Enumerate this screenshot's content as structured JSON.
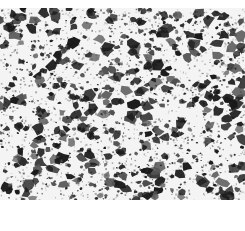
{
  "image": {
    "kind": "grayscale micrograph texture",
    "description": "Dense random speckle of dark irregular grains on a light gray/white matrix",
    "region": {
      "x": 0,
      "y": 8,
      "width": 245,
      "height": 192
    },
    "colors": {
      "background": "#ffffff",
      "matrix": "#f4f4f4",
      "grain_dark": "#1a1a1a",
      "grain_mid": "#555555",
      "grain_light": "#9a9a9a"
    },
    "texture": {
      "seed": 20240611,
      "grain_count": 900,
      "fine_speck_count": 1400
    }
  }
}
